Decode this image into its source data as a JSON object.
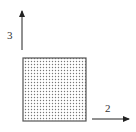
{
  "diagram": {
    "square": {
      "x": 23,
      "y": 58,
      "size": 63,
      "fill_pattern": "dotted",
      "border_color": "#555555",
      "dot_color": "#777777"
    },
    "axes": [
      {
        "id": "axis-3",
        "label": "3",
        "direction": "up",
        "x1": 22,
        "y1": 50,
        "x2": 22,
        "y2": 9
      },
      {
        "id": "axis-2",
        "label": "2",
        "direction": "right",
        "x1": 92,
        "y1": 119,
        "x2": 131,
        "y2": 119
      }
    ],
    "stroke_color": "#222222"
  }
}
